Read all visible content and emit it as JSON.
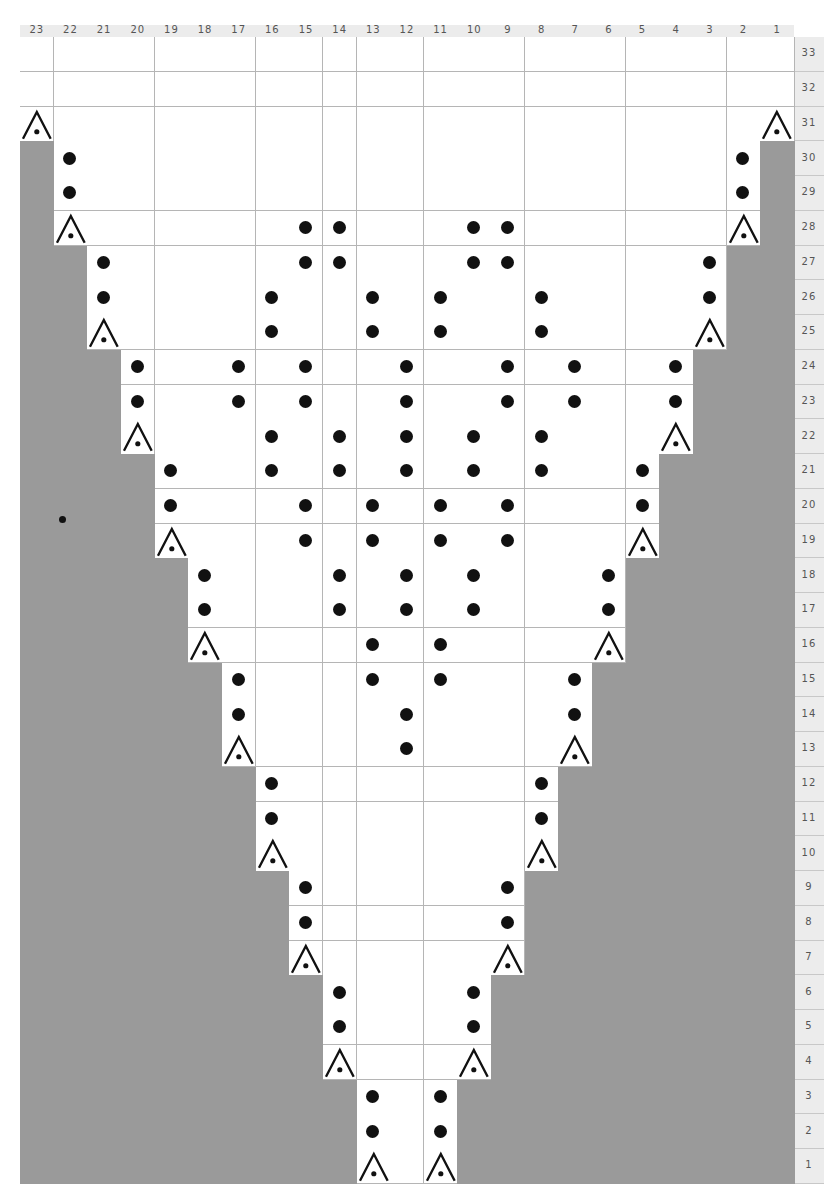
{
  "chart_data": {
    "type": "table",
    "title": "",
    "columns": 23,
    "rows": 33,
    "column_labels": [
      "23",
      "22",
      "21",
      "20",
      "19",
      "18",
      "17",
      "16",
      "15",
      "14",
      "13",
      "12",
      "11",
      "10",
      "9",
      "8",
      "7",
      "6",
      "5",
      "4",
      "3",
      "2",
      "1"
    ],
    "row_labels": [
      "33",
      "32",
      "31",
      "30",
      "29",
      "28",
      "27",
      "26",
      "25",
      "24",
      "23",
      "22",
      "21",
      "20",
      "19",
      "18",
      "17",
      "16",
      "15",
      "14",
      "13",
      "12",
      "11",
      "10",
      "9",
      "8",
      "7",
      "6",
      "5",
      "4",
      "3",
      "2",
      "1"
    ],
    "legend": {
      "dot": "bead / purl symbol (filled circle)",
      "A": "decrease symbol (caret with dot)",
      "gray": "no stitch"
    },
    "colors": {
      "no_stitch": "#9a9a9a",
      "stitch": "#ffffff",
      "grid": "#b5b5b5",
      "symbol": "#111111",
      "header": "#ececec"
    },
    "rows_data": [
      {
        "row": 33,
        "span": [
          1,
          23
        ],
        "dots": [],
        "decreases": []
      },
      {
        "row": 32,
        "span": [
          1,
          23
        ],
        "dots": [],
        "decreases": []
      },
      {
        "row": 31,
        "span": [
          1,
          23
        ],
        "dots": [],
        "decreases": [
          23,
          1
        ]
      },
      {
        "row": 30,
        "span": [
          2,
          22
        ],
        "dots": [
          22,
          2
        ],
        "decreases": []
      },
      {
        "row": 29,
        "span": [
          2,
          22
        ],
        "dots": [
          22,
          2
        ],
        "decreases": []
      },
      {
        "row": 28,
        "span": [
          2,
          22
        ],
        "dots": [
          15,
          14,
          10,
          9
        ],
        "decreases": [
          22,
          2
        ]
      },
      {
        "row": 27,
        "span": [
          3,
          21
        ],
        "dots": [
          21,
          15,
          14,
          10,
          9,
          3
        ],
        "decreases": []
      },
      {
        "row": 26,
        "span": [
          3,
          21
        ],
        "dots": [
          21,
          16,
          13,
          11,
          8,
          3
        ],
        "decreases": []
      },
      {
        "row": 25,
        "span": [
          3,
          21
        ],
        "dots": [
          16,
          13,
          11,
          8
        ],
        "decreases": [
          21,
          3
        ]
      },
      {
        "row": 24,
        "span": [
          4,
          20
        ],
        "dots": [
          20,
          17,
          15,
          12,
          9,
          7,
          4
        ],
        "decreases": []
      },
      {
        "row": 23,
        "span": [
          4,
          20
        ],
        "dots": [
          20,
          17,
          15,
          12,
          9,
          7,
          4
        ],
        "decreases": []
      },
      {
        "row": 22,
        "span": [
          4,
          20
        ],
        "dots": [
          16,
          14,
          12,
          10,
          8
        ],
        "decreases": [
          20,
          4
        ]
      },
      {
        "row": 21,
        "span": [
          5,
          19
        ],
        "dots": [
          19,
          16,
          14,
          12,
          10,
          8,
          5
        ],
        "decreases": []
      },
      {
        "row": 20,
        "span": [
          5,
          19
        ],
        "dots": [
          19,
          15,
          13,
          11,
          9,
          5
        ],
        "decreases": []
      },
      {
        "row": 19,
        "span": [
          5,
          19
        ],
        "dots": [
          15,
          13,
          11,
          9
        ],
        "decreases": [
          19,
          5
        ]
      },
      {
        "row": 18,
        "span": [
          6,
          18
        ],
        "dots": [
          18,
          14,
          12,
          10,
          6
        ],
        "decreases": []
      },
      {
        "row": 17,
        "span": [
          6,
          18
        ],
        "dots": [
          18,
          14,
          12,
          10,
          6
        ],
        "decreases": []
      },
      {
        "row": 16,
        "span": [
          6,
          18
        ],
        "dots": [
          13,
          11
        ],
        "decreases": [
          18,
          6
        ]
      },
      {
        "row": 15,
        "span": [
          7,
          17
        ],
        "dots": [
          17,
          13,
          11,
          7
        ],
        "decreases": []
      },
      {
        "row": 14,
        "span": [
          7,
          17
        ],
        "dots": [
          17,
          12,
          7
        ],
        "decreases": []
      },
      {
        "row": 13,
        "span": [
          7,
          17
        ],
        "dots": [
          12
        ],
        "decreases": [
          17,
          7
        ]
      },
      {
        "row": 12,
        "span": [
          8,
          16
        ],
        "dots": [
          16,
          8
        ],
        "decreases": []
      },
      {
        "row": 11,
        "span": [
          8,
          16
        ],
        "dots": [
          16,
          8
        ],
        "decreases": []
      },
      {
        "row": 10,
        "span": [
          8,
          16
        ],
        "dots": [],
        "decreases": [
          16,
          8
        ]
      },
      {
        "row": 9,
        "span": [
          9,
          15
        ],
        "dots": [
          15,
          9
        ],
        "decreases": []
      },
      {
        "row": 8,
        "span": [
          9,
          15
        ],
        "dots": [
          15,
          9
        ],
        "decreases": []
      },
      {
        "row": 7,
        "span": [
          9,
          15
        ],
        "dots": [],
        "decreases": [
          15,
          9
        ]
      },
      {
        "row": 6,
        "span": [
          10,
          14
        ],
        "dots": [
          14,
          10
        ],
        "decreases": []
      },
      {
        "row": 5,
        "span": [
          10,
          14
        ],
        "dots": [
          14,
          10
        ],
        "decreases": []
      },
      {
        "row": 4,
        "span": [
          10,
          14
        ],
        "dots": [],
        "decreases": [
          14,
          10
        ]
      },
      {
        "row": 3,
        "span": [
          11,
          13
        ],
        "dots": [
          13,
          11
        ],
        "decreases": []
      },
      {
        "row": 2,
        "span": [
          11,
          13
        ],
        "dots": [
          13,
          11
        ],
        "decreases": []
      },
      {
        "row": 1,
        "span": [
          11,
          13
        ],
        "dots": [],
        "decreases": [
          13,
          11
        ]
      }
    ]
  },
  "geometry": {
    "grid_left": 20,
    "grid_top": 37,
    "cell_w": 33.65,
    "cell_h": 34.75
  }
}
